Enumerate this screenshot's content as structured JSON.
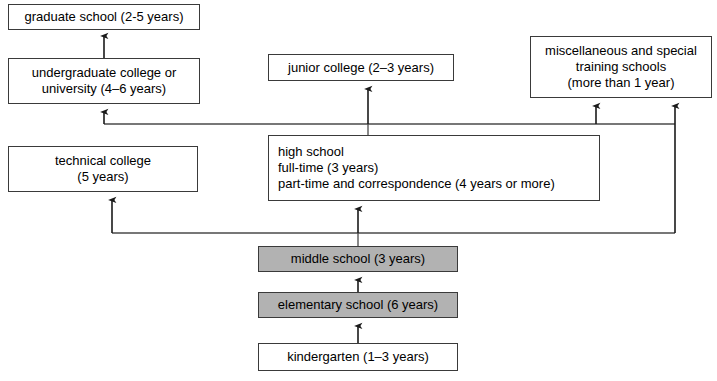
{
  "diagram": {
    "type": "flowchart",
    "colors": {
      "compulsory_fill": "#b2b2b2",
      "optional_fill": "#ffffff",
      "stroke": "#3a3a3a",
      "text": "#000000"
    },
    "nodes": [
      {
        "id": "graduate-school",
        "lines": [
          "graduate school (2-5 years)"
        ],
        "shaded": false,
        "x": 8,
        "y": 4,
        "w": 192,
        "h": 26
      },
      {
        "id": "undergraduate-college",
        "lines": [
          "undergraduate college or",
          "university (4–6 years)"
        ],
        "shaded": false,
        "x": 8,
        "y": 58,
        "w": 192,
        "h": 46
      },
      {
        "id": "junior-college",
        "lines": [
          "junior college (2–3 years)"
        ],
        "shaded": false,
        "x": 268,
        "y": 54,
        "w": 186,
        "h": 27
      },
      {
        "id": "miscellaneous-training-schools",
        "lines": [
          "miscellaneous and special",
          "training schools",
          "(more than 1 year)"
        ],
        "shaded": false,
        "x": 530,
        "y": 36,
        "w": 182,
        "h": 62
      },
      {
        "id": "technical-college",
        "lines": [
          "technical college",
          "(5 years)"
        ],
        "shaded": false,
        "x": 8,
        "y": 146,
        "w": 190,
        "h": 46
      },
      {
        "id": "high-school",
        "lines": [
          "high school",
          "full-time (3 years)",
          "part-time and correspondence (4 years or more)"
        ],
        "shaded": false,
        "align": "left",
        "x": 268,
        "y": 135,
        "w": 332,
        "h": 66
      },
      {
        "id": "middle-school",
        "lines": [
          "middle school (3 years)"
        ],
        "shaded": true,
        "x": 258,
        "y": 246,
        "w": 200,
        "h": 26
      },
      {
        "id": "elementary-school",
        "lines": [
          "elementary school (6 years)"
        ],
        "shaded": true,
        "x": 258,
        "y": 292,
        "w": 200,
        "h": 26
      },
      {
        "id": "kindergarten",
        "lines": [
          "kindergarten (1–3 years)"
        ],
        "shaded": false,
        "x": 258,
        "y": 343,
        "w": 200,
        "h": 28
      }
    ],
    "edges": [
      {
        "id": "undergraduate-to-graduate",
        "from": "undergraduate-college",
        "to": "graduate-school"
      },
      {
        "id": "highschool-to-undergraduate",
        "from": "high-school",
        "to": "undergraduate-college"
      },
      {
        "id": "highschool-to-junior-college",
        "from": "high-school",
        "to": "junior-college"
      },
      {
        "id": "highschool-to-miscellaneous",
        "from": "high-school",
        "to": "miscellaneous-training-schools"
      },
      {
        "id": "middleschool-to-technical-college",
        "from": "middle-school",
        "to": "technical-college"
      },
      {
        "id": "middleschool-to-highschool",
        "from": "middle-school",
        "to": "high-school"
      },
      {
        "id": "middleschool-to-miscellaneous",
        "from": "middle-school",
        "to": "miscellaneous-training-schools"
      },
      {
        "id": "elementary-to-middleschool",
        "from": "elementary-school",
        "to": "middle-school"
      },
      {
        "id": "kindergarten-to-elementary",
        "from": "kindergarten",
        "to": "elementary-school"
      }
    ]
  }
}
